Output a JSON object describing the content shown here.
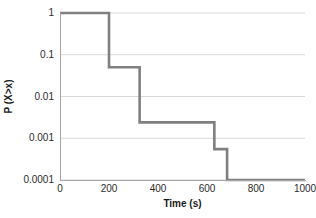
{
  "chart_data": {
    "type": "line",
    "subtype": "step-ccdf",
    "title": "",
    "xlabel": "Time (s)",
    "ylabel": "P (X>x)",
    "xlim": [
      0,
      1000
    ],
    "ylim": [
      0.0001,
      1
    ],
    "yscale": "log",
    "xscale": "linear",
    "grid": {
      "horizontal": true,
      "vertical": false
    },
    "legend": null,
    "xticks": [
      0,
      200,
      400,
      600,
      800,
      1000
    ],
    "xticklabels": [
      "0",
      "200",
      "400",
      "600",
      "800",
      "1000"
    ],
    "yticks": [
      1,
      0.1,
      0.01,
      0.001,
      0.0001
    ],
    "yticklabels": [
      "1",
      "0.1",
      "0.01",
      "0.001",
      "0.0001"
    ],
    "line_color": "#808080",
    "line_width": 2.6,
    "grid_color": "#d9d9d9",
    "axis_color": "#a6a6a6",
    "text_color": "#2b2b2b",
    "background": "#ffffff",
    "series": [
      {
        "name": "P (X>x)",
        "step": "post",
        "x": [
          0,
          200,
          200,
          325,
          325,
          630,
          630,
          682,
          682,
          1000
        ],
        "y": [
          1,
          1,
          0.05,
          0.05,
          0.0024,
          0.0024,
          0.00055,
          0.00055,
          0.0001,
          0.0001
        ],
        "steps": [
          {
            "x_start": 0,
            "x_end": 200,
            "value": 1
          },
          {
            "x_start": 200,
            "x_end": 325,
            "value": 0.05
          },
          {
            "x_start": 325,
            "x_end": 630,
            "value": 0.0024
          },
          {
            "x_start": 630,
            "x_end": 682,
            "value": 0.00055
          },
          {
            "x_start": 682,
            "x_end": 1000,
            "value": 0.0001
          }
        ]
      }
    ]
  }
}
